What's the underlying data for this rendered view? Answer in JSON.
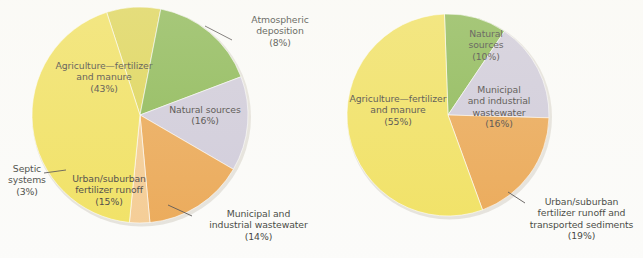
{
  "figure": {
    "background_color": "#fbfbf9",
    "text_color": "#231f20",
    "leader_line_color": "#3a3634"
  },
  "palette": {
    "agriculture": "#efdd4a",
    "atmospheric": "#d9cf3f",
    "natural_sources": "#7bae3c",
    "municipal_wastewater": "#c9c4d6",
    "urban_runoff": "#e89b3c",
    "septic_systems": "#f3c483"
  },
  "chart_data": [
    {
      "type": "pie",
      "id": "left-pie",
      "title": "",
      "center": [
        140,
        115
      ],
      "radius": 108,
      "start_angle_deg": -18,
      "legend": "labels-on-slices-and-leaders",
      "categories": [
        "Atmospheric deposition",
        "Natural sources",
        "Municipal and industrial wastewater",
        "Urban/suburban fertilizer runoff",
        "Septic systems",
        "Agriculture—fertilizer and manure"
      ],
      "values": [
        8,
        16,
        14,
        15,
        3,
        43
      ],
      "colors": [
        "#d9cf3f",
        "#7bae3c",
        "#c9c4d6",
        "#e89b3c",
        "#f3c483",
        "#efdd4a"
      ],
      "labels": [
        {
          "name": "atmospheric-deposition",
          "text": "Atmospheric\ndeposition\n(8%)",
          "value": 8,
          "placement": "leader",
          "x": 237,
          "y": 14,
          "width": 86,
          "align": "center",
          "leader": {
            "x1": 232,
            "y1": 40,
            "x2": 205,
            "y2": 26
          }
        },
        {
          "name": "natural-sources",
          "text": "Natural sources\n(16%)",
          "value": 16,
          "placement": "inside",
          "x": 160,
          "y": 104,
          "width": 90,
          "align": "center"
        },
        {
          "name": "municipal-industrial-wastewater",
          "text": "Municipal and\nindustrial wastewater\n(14%)",
          "value": 14,
          "placement": "leader",
          "x": 195,
          "y": 208,
          "width": 127,
          "align": "center",
          "leader": {
            "x1": 192,
            "y1": 216,
            "x2": 168,
            "y2": 205
          }
        },
        {
          "name": "urban-suburban-fertilizer-runoff",
          "text": "Urban/suburban\nfertilizer runoff\n(15%)",
          "value": 15,
          "placement": "inside",
          "x": 66,
          "y": 173,
          "width": 86,
          "align": "center"
        },
        {
          "name": "septic-systems",
          "text": "Septic\nsystems\n(3%)",
          "value": 3,
          "placement": "leader",
          "x": 2,
          "y": 163,
          "width": 50,
          "align": "center",
          "leader": {
            "x1": 44,
            "y1": 173,
            "x2": 66,
            "y2": 170
          }
        },
        {
          "name": "agriculture-fertilizer-and-manure",
          "text": "Agriculture—fertilizer\nand manure\n(43%)",
          "value": 43,
          "placement": "inside",
          "x": 43,
          "y": 60,
          "width": 122,
          "align": "center"
        }
      ]
    },
    {
      "type": "pie",
      "id": "right-pie",
      "title": "",
      "center": [
        448,
        115
      ],
      "radius": 101,
      "start_angle_deg": -2,
      "legend": "labels-on-slices-and-leaders",
      "categories": [
        "Natural sources",
        "Municipal and industrial wastewater",
        "Urban/suburban fertilizer runoff and transported sediments",
        "Agriculture—fertilizer and manure"
      ],
      "values": [
        10,
        16,
        19,
        55
      ],
      "colors": [
        "#7bae3c",
        "#c9c4d6",
        "#e89b3c",
        "#efdd4a"
      ],
      "labels": [
        {
          "name": "natural-sources",
          "text": "Natural\nsources\n(10%)",
          "value": 10,
          "placement": "inside",
          "x": 457,
          "y": 28,
          "width": 58,
          "align": "center"
        },
        {
          "name": "municipal-industrial-wastewater",
          "text": "Municipal\nand industrial\nwastewater\n(16%)",
          "value": 16,
          "placement": "inside",
          "x": 459,
          "y": 84,
          "width": 80,
          "align": "center"
        },
        {
          "name": "urban-suburban-fertilizer-runoff-sediments",
          "text": "Urban/suburban\nfertilizer runoff and\ntransported sediments\n(19%)",
          "value": 19,
          "placement": "leader",
          "x": 520,
          "y": 196,
          "width": 123,
          "align": "center",
          "leader": {
            "x1": 525,
            "y1": 203,
            "x2": 508,
            "y2": 192
          }
        },
        {
          "name": "agriculture-fertilizer-and-manure",
          "text": "Agriculture—fertilizer\nand manure\n(55%)",
          "value": 55,
          "placement": "inside",
          "x": 337,
          "y": 93,
          "width": 122,
          "align": "center"
        }
      ]
    }
  ]
}
